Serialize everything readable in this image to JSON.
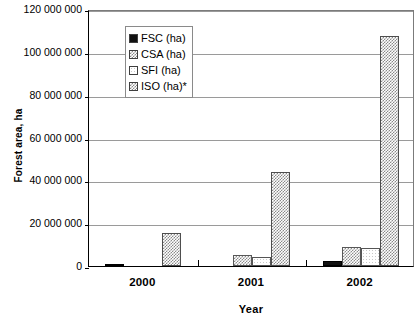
{
  "chart_data": {
    "type": "bar",
    "title": "",
    "xlabel": "Year",
    "ylabel": "Forest area, ha",
    "categories": [
      "2000",
      "2001",
      "2002"
    ],
    "ylim": [
      0,
      120000000
    ],
    "ytick_step": 20000000,
    "ytick_labels": [
      "120 000 000",
      "100 000 000",
      "80 000 000",
      "60 000 000",
      "40 000 000",
      "20 000 000",
      "0"
    ],
    "ytick_values": [
      120000000,
      100000000,
      80000000,
      60000000,
      40000000,
      20000000,
      0
    ],
    "grid": true,
    "legend_position": "top-center",
    "series": [
      {
        "name": "FSC (ha)",
        "pattern": "solid",
        "values": [
          700000,
          0,
          2200000
        ]
      },
      {
        "name": "CSA (ha)",
        "pattern": "cross",
        "values": [
          0,
          5200000,
          9000000
        ]
      },
      {
        "name": "SFI (ha)",
        "pattern": "empty",
        "values": [
          0,
          4200000,
          8300000
        ]
      },
      {
        "name": "ISO (ha)*",
        "pattern": "diagonal",
        "values": [
          15300000,
          44000000,
          107500000
        ]
      }
    ]
  },
  "colors": {
    "axis": "#000000",
    "gridline": "#9a9a9a",
    "plot_background": "#ffffff",
    "legend_border": "#8a8a8a"
  }
}
